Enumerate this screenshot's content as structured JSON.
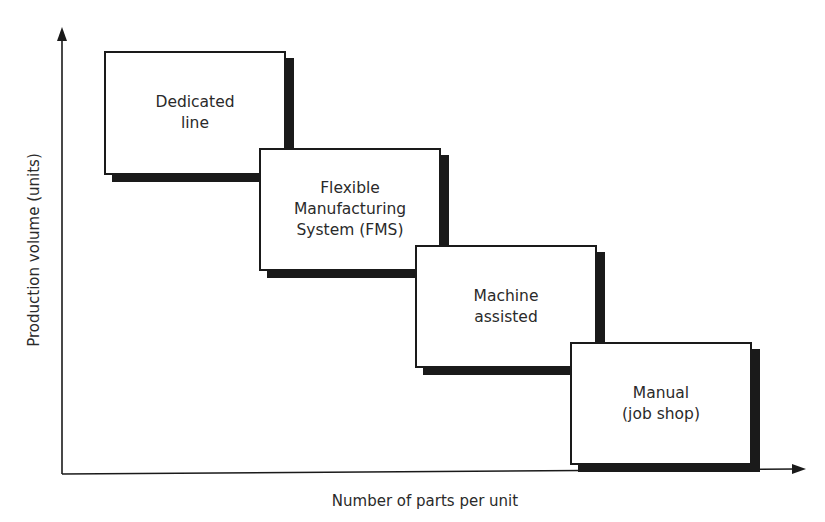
{
  "diagram": {
    "y_axis_label": "Production volume (units)",
    "x_axis_label": "Number of parts per unit",
    "boxes": [
      {
        "label": "Dedicated\nline"
      },
      {
        "label": "Flexible\nManufacturing\nSystem (FMS)"
      },
      {
        "label": "Machine\nassisted"
      },
      {
        "label": "Manual\n(job shop)"
      }
    ]
  }
}
